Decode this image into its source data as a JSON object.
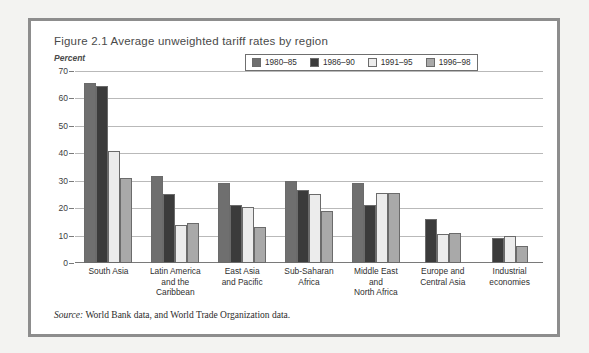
{
  "figure": {
    "title": "Figure 2.1  Average unweighted tariff rates by region",
    "axis_unit": "Percent",
    "source_prefix": "Source:",
    "source_text": " World Bank data, and World Trade Organization data."
  },
  "colors": {
    "series_1980_85": "#6f6f6f",
    "series_1986_90": "#3b3b3b",
    "series_1991_95": "#ececec",
    "series_1996_98": "#a9a9a9",
    "bar_outline": "#6b6b6b",
    "gridline": "#b9b9b9",
    "frame": "#8d8d8d",
    "page_background": "#f3f3f1"
  },
  "chart_data": {
    "type": "bar",
    "title": "Figure 2.1  Average unweighted tariff rates by region",
    "xlabel": "",
    "ylabel": "Percent",
    "ylim": [
      0,
      70
    ],
    "yticks": [
      0,
      10,
      20,
      30,
      40,
      50,
      60,
      70
    ],
    "grid": true,
    "legend_position": "top-right (inside plot)",
    "categories": [
      "South Asia",
      "Latin America and the Caribbean",
      "East Asia and Pacific",
      "Sub-Saharan Africa",
      "Middle East and North Africa",
      "Europe and Central Asia",
      "Industrial economies"
    ],
    "category_lines": [
      [
        "South Asia"
      ],
      [
        "Latin America",
        "and the",
        "Caribbean"
      ],
      [
        "East Asia",
        "and Pacific"
      ],
      [
        "Sub-Saharan",
        "Africa"
      ],
      [
        "Middle East",
        "and",
        "North Africa"
      ],
      [
        "Europe and",
        "Central Asia"
      ],
      [
        "Industrial",
        "economies"
      ]
    ],
    "series": [
      {
        "name": "1980-85",
        "label": "1980–85",
        "color": "#6f6f6f",
        "values": [
          65.5,
          31.8,
          29.3,
          29.8,
          29.0,
          null,
          null
        ]
      },
      {
        "name": "1986-90",
        "label": "1986–90",
        "color": "#3b3b3b",
        "values": [
          64.5,
          25.0,
          21.0,
          26.5,
          21.0,
          16.0,
          9.3
        ]
      },
      {
        "name": "1991-95",
        "label": "1991–95",
        "color": "#ececec",
        "values": [
          41.0,
          13.8,
          20.5,
          25.3,
          25.5,
          10.5,
          10.0
        ]
      },
      {
        "name": "1996-98",
        "label": "1996–98",
        "color": "#a9a9a9",
        "values": [
          31.0,
          14.6,
          13.0,
          18.8,
          25.5,
          11.0,
          6.3
        ]
      }
    ]
  }
}
